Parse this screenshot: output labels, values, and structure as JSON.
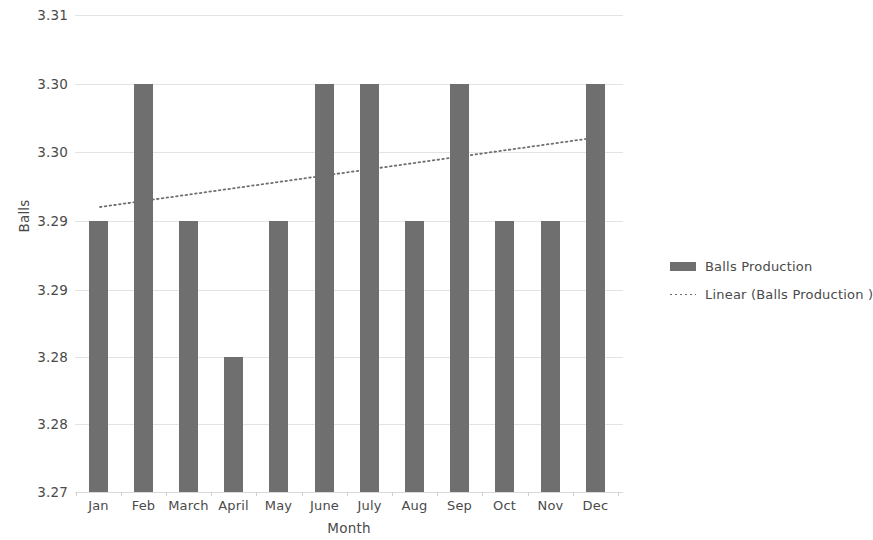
{
  "chart_data": {
    "type": "bar",
    "title": "",
    "xlabel": "Month",
    "ylabel": "Balls",
    "categories": [
      "Jan",
      "Feb",
      "March",
      "April",
      "May",
      "June",
      "July",
      "Aug",
      "Sep",
      "Oct",
      "Nov",
      "Dec"
    ],
    "series": [
      {
        "name": "Balls Production",
        "type": "bar",
        "color": "#6f6f6f",
        "values": [
          3.2925,
          3.3015,
          3.2925,
          3.2835,
          3.2925,
          3.3015,
          3.3015,
          3.2925,
          3.3015,
          3.2925,
          3.2925,
          3.3015
        ]
      },
      {
        "name": "Linear (Balls Production )",
        "type": "line",
        "style": "dotted",
        "color": "#6f6f6f",
        "x": [
          "Jan",
          "Dec"
        ],
        "values": [
          3.2944,
          3.3036
        ]
      }
    ],
    "ytick_labels": [
      "3.31",
      "3.30",
      "3.30",
      "3.29",
      "3.29",
      "3.28",
      "3.28",
      "3.27"
    ],
    "ytick_values": [
      3.3145,
      3.3055,
      3.2965,
      3.2875,
      3.2785,
      3.2695,
      3.2605,
      3.2515
    ],
    "ylim": [
      3.2515,
      3.3145
    ],
    "grid": true,
    "legend_position": "right",
    "legend": [
      "Balls Production",
      "Linear (Balls Production )"
    ]
  },
  "axes": {
    "y_title": "Balls",
    "x_title": "Month"
  },
  "geometry": {
    "plot_left": 75,
    "plot_top": 15,
    "plot_width": 548,
    "plot_height": 477,
    "gridline_y": [
      0,
      69,
      137,
      206,
      275,
      342,
      409,
      477
    ],
    "bar_width": 19,
    "bar_x": [
      14,
      59,
      104,
      149,
      194,
      240,
      285,
      330,
      375,
      420,
      466,
      511
    ],
    "bar_top_y": [
      206,
      69,
      206,
      342,
      206,
      69,
      69,
      206,
      69,
      206,
      206,
      69
    ],
    "trend_x1": 25,
    "trend_y1": 192,
    "trend_x2": 525,
    "trend_y2": 122
  }
}
